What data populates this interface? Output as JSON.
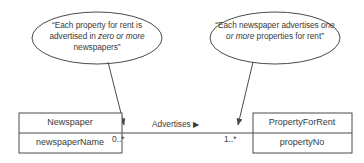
{
  "diagram": {
    "kind": "uml-class-diagram",
    "background_color": "#ffffff",
    "line_color": "#4a4a4a",
    "text_color": "#3a3a3a"
  },
  "notes": [
    {
      "id": "note-left",
      "segments": [
        {
          "text": "“Each property for rent is advertised in ",
          "italic": false
        },
        {
          "text": "zero or more",
          "italic": true
        },
        {
          "text": " newspapers”",
          "italic": false
        }
      ],
      "plain_text": "“Each property for rent is advertised in zero or more newspapers”"
    },
    {
      "id": "note-right",
      "segments": [
        {
          "text": "“Each newspaper advertises ",
          "italic": false
        },
        {
          "text": "one or more",
          "italic": true
        },
        {
          "text": " properties for rent”",
          "italic": false
        }
      ],
      "plain_text": "“Each newspaper advertises one or more properties for rent”"
    }
  ],
  "classes": [
    {
      "id": "newspaper",
      "name": "Newspaper",
      "attribute": "newspaperName"
    },
    {
      "id": "property-for-rent",
      "name": "PropertyForRent",
      "attribute": "propertyNo"
    }
  ],
  "association": {
    "name": "Advertises",
    "direction_marker": "▶",
    "multiplicity_left": "0..*",
    "multiplicity_right": "1..*"
  }
}
